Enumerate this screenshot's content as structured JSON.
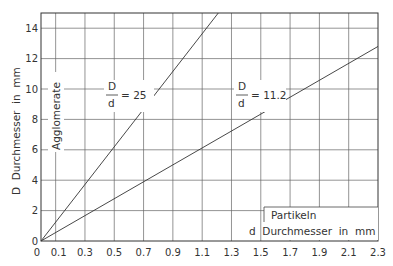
{
  "chart_data": {
    "type": "line",
    "title": "",
    "xlabel": "d  Durchmesser  in  mm",
    "xlabel_top": "Partikeln",
    "ylabel": "D  Durchmesser  in  mm",
    "ylabel_inner": "Agglomerate",
    "xlim": [
      0,
      2.3
    ],
    "ylim": [
      0,
      15
    ],
    "x_ticks": [
      "0",
      "0.1",
      "0.3",
      "0.5",
      "0.7",
      "0.9",
      "1.1",
      "1.3",
      "1.5",
      "1.7",
      "1.9",
      "2.1",
      "2.3"
    ],
    "x_tick_values": [
      0,
      0.1,
      0.3,
      0.5,
      0.7,
      0.9,
      1.1,
      1.3,
      1.5,
      1.7,
      1.9,
      2.1,
      2.3
    ],
    "y_ticks": [
      "0",
      "2",
      "4",
      "6",
      "8",
      "10",
      "12",
      "14"
    ],
    "y_tick_values": [
      0,
      2,
      4,
      6,
      8,
      10,
      12,
      14
    ],
    "grid": true,
    "series": [
      {
        "name": "D/d = 25",
        "label_num": "D",
        "label_den": "d",
        "label_value": "= 25",
        "x": [
          0,
          1.21
        ],
        "y": [
          0,
          15
        ]
      },
      {
        "name": "D/d = 11.2",
        "label_num": "D",
        "label_den": "d",
        "label_value": "= 11.2",
        "x": [
          0,
          2.3
        ],
        "y": [
          0,
          12.8
        ]
      }
    ]
  }
}
